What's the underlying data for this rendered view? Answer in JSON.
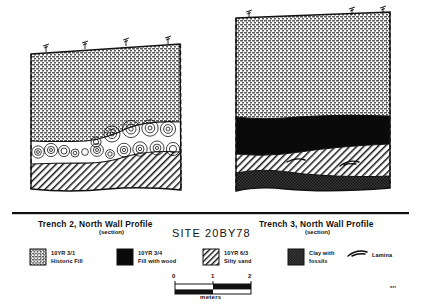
{
  "figure": {
    "site_title": "SITE 20BY78",
    "corner_mark": "art"
  },
  "panels": [
    {
      "id": "trench-2",
      "title": "Trench 2, North Wall Profile",
      "subtitle": "(section)",
      "stake_count": 4,
      "layers": [
        {
          "name": "Historic Fill",
          "code": "10YR 3/1",
          "pattern": "grid-stipple"
        },
        {
          "name": "Fill with wood (logs)",
          "code": "10YR 3/4",
          "pattern": "logs"
        },
        {
          "name": "Silty sand",
          "code": "10YR 6/3",
          "pattern": "diagonal-hatch"
        }
      ]
    },
    {
      "id": "trench-3",
      "title": "Trench 3, North Wall Profile",
      "subtitle": "(section)",
      "stake_count": 3,
      "layers": [
        {
          "name": "Historic Fill",
          "code": "10YR 3/1",
          "pattern": "grid-stipple"
        },
        {
          "name": "Fill with wood",
          "code": "10YR 3/4",
          "pattern": "solid-black"
        },
        {
          "name": "Silty sand",
          "code": "10YR 6/3",
          "pattern": "diagonal-hatch"
        },
        {
          "name": "Clay with fossils",
          "code": "",
          "pattern": "dark-stipple"
        }
      ],
      "lamina_count": 2
    }
  ],
  "legend": {
    "items": [
      {
        "code": "10YR 3/1",
        "label": "Historic Fill",
        "pattern": "grid-stipple"
      },
      {
        "code": "10YR 3/4",
        "label": "Fill with wood",
        "pattern": "solid-black"
      },
      {
        "code": "10YR 6/3",
        "label": "Silty sand",
        "pattern": "diagonal-hatch"
      },
      {
        "code": "Clay with",
        "label": "fossils",
        "pattern": "dark-stipple"
      },
      {
        "code": "Lamina",
        "label": "",
        "pattern": "lamina-symbol"
      }
    ]
  },
  "scale": {
    "ticks": [
      "0",
      "1",
      "2"
    ],
    "units": "meters"
  }
}
